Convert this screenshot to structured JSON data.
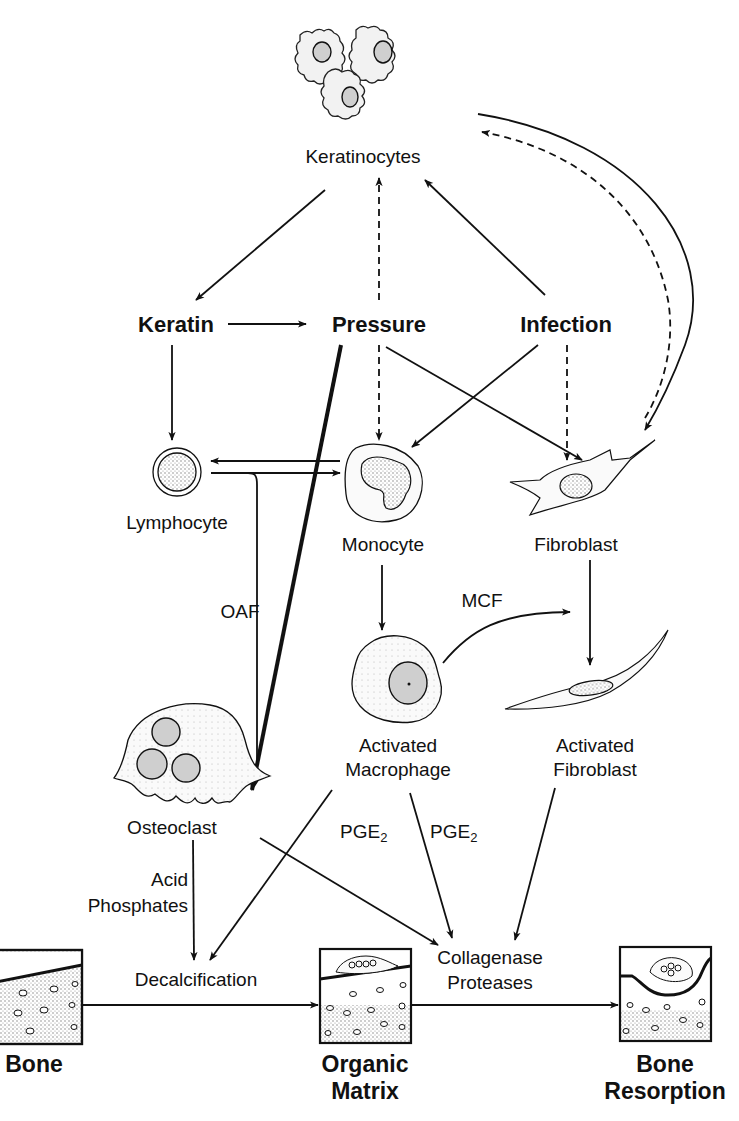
{
  "diagram": {
    "nodes": {
      "keratinocytes": "Keratinocytes",
      "keratin": "Keratin",
      "pressure": "Pressure",
      "infection": "Infection",
      "lymphocyte": "Lymphocyte",
      "monocyte": "Monocyte",
      "fibroblast": "Fibroblast",
      "osteoclast": "Osteoclast",
      "activated_macrophage_1": "Activated",
      "activated_macrophage_2": "Macrophage",
      "activated_fibroblast_1": "Activated",
      "activated_fibroblast_2": "Fibroblast",
      "decalcification": "Decalcification",
      "collagenase_1": "Collagenase",
      "collagenase_2": "Proteases",
      "bone": "Bone",
      "organic_matrix_1": "Organic",
      "organic_matrix_2": "Matrix",
      "bone_resorption_1": "Bone",
      "bone_resorption_2": "Resorption"
    },
    "edge_labels": {
      "oaf": "OAF",
      "mcf": "MCF",
      "pge2_left": "PGE",
      "pge2_right": "PGE",
      "pge_subscript": "2",
      "acid_1": "Acid",
      "acid_2": "Phosphates"
    },
    "edges": [
      {
        "from": "Keratinocytes",
        "to": "Keratin",
        "style": "solid"
      },
      {
        "from": "Pressure",
        "to": "Keratinocytes",
        "style": "dashed"
      },
      {
        "from": "Infection",
        "to": "Keratinocytes",
        "style": "solid"
      },
      {
        "from": "Keratin",
        "to": "Pressure",
        "style": "solid"
      },
      {
        "from": "Keratin",
        "to": "Lymphocyte",
        "style": "solid"
      },
      {
        "from": "Pressure",
        "to": "Monocyte",
        "style": "dashed"
      },
      {
        "from": "Pressure",
        "to": "Fibroblast",
        "style": "solid"
      },
      {
        "from": "Pressure",
        "to": "Osteoclast",
        "style": "thick"
      },
      {
        "from": "Infection",
        "to": "Monocyte",
        "style": "solid"
      },
      {
        "from": "Infection",
        "to": "Fibroblast",
        "style": "dashed"
      },
      {
        "from": "Monocyte",
        "to": "Lymphocyte",
        "style": "solid"
      },
      {
        "from": "Lymphocyte",
        "to": "Monocyte",
        "style": "solid"
      },
      {
        "from": "Lymphocyte",
        "to": "Osteoclast",
        "style": "solid",
        "label": "OAF"
      },
      {
        "from": "Keratinocytes",
        "to": "Fibroblast",
        "style": "solid-curved"
      },
      {
        "from": "Fibroblast",
        "to": "Keratinocytes",
        "style": "dashed-curved"
      },
      {
        "from": "Monocyte",
        "to": "Activated Macrophage",
        "style": "solid"
      },
      {
        "from": "Activated Macrophage",
        "to": "Activated Fibroblast",
        "style": "solid-curved",
        "label": "MCF"
      },
      {
        "from": "Fibroblast",
        "to": "Activated Fibroblast",
        "style": "solid"
      },
      {
        "from": "Osteoclast",
        "to": "Decalcification",
        "style": "solid",
        "label": "Acid Phosphates"
      },
      {
        "from": "Osteoclast",
        "to": "Collagenase Proteases",
        "style": "solid"
      },
      {
        "from": "Activated Macrophage",
        "to": "Decalcification",
        "style": "solid",
        "label": "PGE2"
      },
      {
        "from": "Activated Macrophage",
        "to": "Collagenase Proteases",
        "style": "solid",
        "label": "PGE2"
      },
      {
        "from": "Activated Fibroblast",
        "to": "Collagenase Proteases",
        "style": "solid"
      },
      {
        "from": "Bone",
        "to": "Organic Matrix",
        "style": "solid"
      },
      {
        "from": "Organic Matrix",
        "to": "Bone Resorption",
        "style": "solid"
      }
    ],
    "colors": {
      "ink": "#111111",
      "background": "#ffffff",
      "stipple": "#cfcfcf"
    }
  }
}
